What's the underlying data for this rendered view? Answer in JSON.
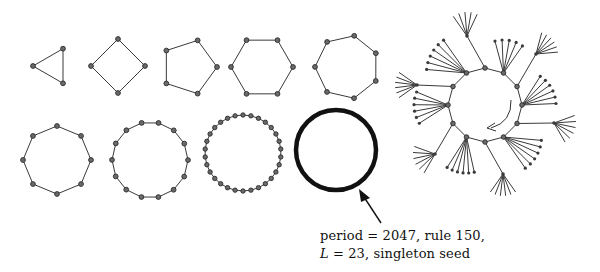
{
  "figure": {
    "cycles": [
      {
        "name": "cycle-3",
        "period": 3,
        "cx": 53,
        "cy": 66,
        "r": 20,
        "rot": 180
      },
      {
        "name": "cycle-4",
        "period": 4,
        "cx": 118,
        "cy": 66,
        "r": 27,
        "rot": -90
      },
      {
        "name": "cycle-5",
        "period": 5,
        "cx": 189,
        "cy": 67,
        "r": 28,
        "rot": 0
      },
      {
        "name": "cycle-6",
        "period": 6,
        "cx": 262,
        "cy": 67,
        "r": 31,
        "rot": 0
      },
      {
        "name": "cycle-7",
        "period": 7,
        "cx": 347,
        "cy": 67,
        "r": 32,
        "rot": -77
      },
      {
        "name": "cycle-8",
        "period": 8,
        "cx": 57,
        "cy": 160,
        "r": 34,
        "rot": -90
      },
      {
        "name": "cycle-14",
        "period": 14,
        "cx": 150,
        "cy": 160,
        "r": 38,
        "rot": -77
      },
      {
        "name": "cycle-30",
        "period": 30,
        "cx": 243,
        "cy": 153,
        "r": 38,
        "rot": -90
      }
    ],
    "large_cycle": {
      "name": "cycle-2047",
      "cx": 336,
      "cy": 150,
      "r": 40,
      "stroke_width": 4
    },
    "annotation": {
      "line1": "period = 2047, rule 150,",
      "line2_var": "L",
      "line2_rest": " = 23, singleton seed"
    },
    "basin_tree": {
      "ring_center": [
        485,
        105
      ],
      "ring_radius": 37,
      "ring_nodes": 12
    }
  }
}
